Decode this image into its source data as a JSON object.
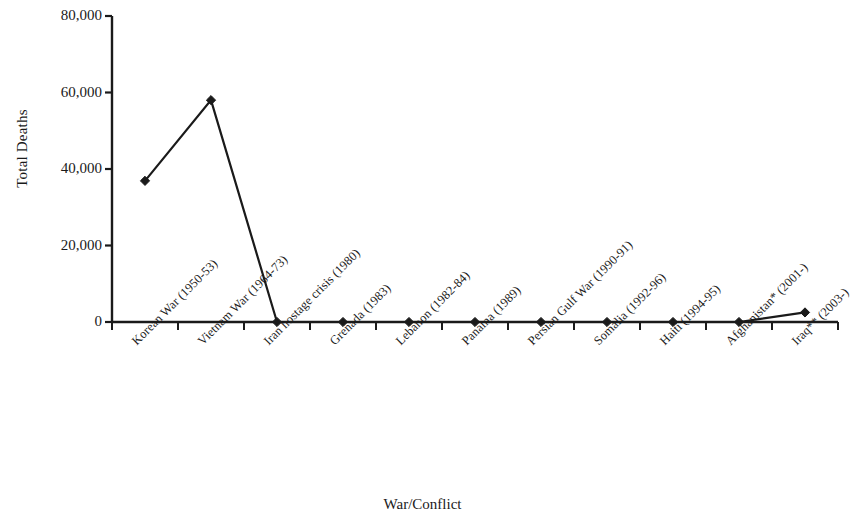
{
  "chart_data": {
    "type": "line",
    "title": "",
    "xlabel": "War/Conflict",
    "ylabel": "Total Deaths",
    "categories": [
      "Korean War (1950-53)",
      "Vietnam War (1964-73)",
      "Iran hostage crisis (1980)",
      "Grenada (1983)",
      "Lebanon (1982-84)",
      "Panama (1989)",
      "Persian Gulf War (1990-91)",
      "Somalia (1992-96)",
      "Haiti (1994-95)",
      "Afghanistan* (2001-)",
      "Iraq** (2003-)"
    ],
    "values": [
      36900,
      58000,
      0,
      0,
      0,
      0,
      0,
      0,
      0,
      0,
      2500
    ],
    "ylim": [
      0,
      80000
    ],
    "ytick_labels": [
      "80,000",
      "60,000",
      "40,000",
      "20,000",
      "0"
    ],
    "ytick_values": [
      80000,
      60000,
      40000,
      20000,
      0
    ],
    "grid": false,
    "legend": false,
    "legend_position": "none",
    "marker": "diamond",
    "series_color": "#1a1a1a",
    "axis_color": "#1a1a1a",
    "background_color": "#ffffff"
  }
}
